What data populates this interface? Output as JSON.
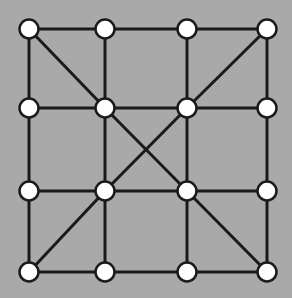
{
  "diagram": {
    "type": "node-graph-board",
    "background": "#a9a9a9",
    "line_color": "#1a1a1a",
    "node_fill": "#ffffff",
    "node_stroke": "#1a1a1a",
    "columns_x": [
      29,
      105,
      187,
      267
    ],
    "rows_y": [
      29,
      108,
      191,
      272
    ],
    "nodes": [
      {
        "id": "r0c0",
        "row": 0,
        "col": 0
      },
      {
        "id": "r0c1",
        "row": 0,
        "col": 1
      },
      {
        "id": "r0c2",
        "row": 0,
        "col": 2
      },
      {
        "id": "r0c3",
        "row": 0,
        "col": 3
      },
      {
        "id": "r1c0",
        "row": 1,
        "col": 0
      },
      {
        "id": "r1c1",
        "row": 1,
        "col": 1
      },
      {
        "id": "r1c2",
        "row": 1,
        "col": 2
      },
      {
        "id": "r1c3",
        "row": 1,
        "col": 3
      },
      {
        "id": "r2c0",
        "row": 2,
        "col": 0
      },
      {
        "id": "r2c1",
        "row": 2,
        "col": 1
      },
      {
        "id": "r2c2",
        "row": 2,
        "col": 2
      },
      {
        "id": "r2c3",
        "row": 2,
        "col": 3
      },
      {
        "id": "r3c0",
        "row": 3,
        "col": 0
      },
      {
        "id": "r3c1",
        "row": 3,
        "col": 1
      },
      {
        "id": "r3c2",
        "row": 3,
        "col": 2
      },
      {
        "id": "r3c3",
        "row": 3,
        "col": 3
      }
    ],
    "edges": [
      [
        "r0c0",
        "r0c1"
      ],
      [
        "r0c1",
        "r0c2"
      ],
      [
        "r0c2",
        "r0c3"
      ],
      [
        "r1c0",
        "r1c1"
      ],
      [
        "r1c1",
        "r1c2"
      ],
      [
        "r1c2",
        "r1c3"
      ],
      [
        "r2c0",
        "r2c1"
      ],
      [
        "r2c1",
        "r2c2"
      ],
      [
        "r2c2",
        "r2c3"
      ],
      [
        "r3c0",
        "r3c1"
      ],
      [
        "r3c1",
        "r3c2"
      ],
      [
        "r3c2",
        "r3c3"
      ],
      [
        "r0c0",
        "r1c0"
      ],
      [
        "r1c0",
        "r2c0"
      ],
      [
        "r2c0",
        "r3c0"
      ],
      [
        "r0c1",
        "r1c1"
      ],
      [
        "r1c1",
        "r2c1"
      ],
      [
        "r2c1",
        "r3c1"
      ],
      [
        "r0c2",
        "r1c2"
      ],
      [
        "r1c2",
        "r2c2"
      ],
      [
        "r2c2",
        "r3c2"
      ],
      [
        "r0c3",
        "r1c3"
      ],
      [
        "r1c3",
        "r2c3"
      ],
      [
        "r2c3",
        "r3c3"
      ],
      [
        "r0c0",
        "r1c1"
      ],
      [
        "r0c3",
        "r1c2"
      ],
      [
        "r1c1",
        "r2c2"
      ],
      [
        "r1c2",
        "r2c1"
      ],
      [
        "r2c1",
        "r3c0"
      ],
      [
        "r2c2",
        "r3c3"
      ]
    ]
  }
}
